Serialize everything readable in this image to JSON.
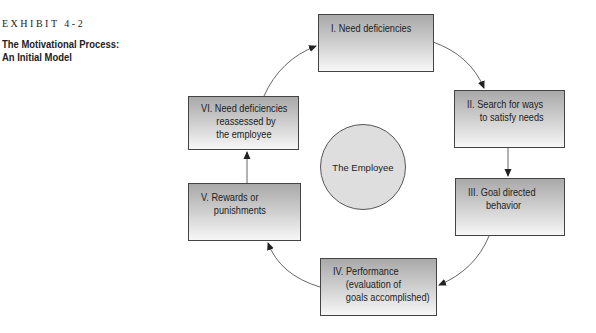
{
  "exhibit": {
    "label": "EXHIBIT 4-2"
  },
  "title": {
    "line1": "The Motivational Process:",
    "line2": "An Initial Model"
  },
  "center": {
    "label": "The Employee"
  },
  "steps": [
    {
      "id": "I",
      "text": "I. Need deficiencies"
    },
    {
      "id": "II",
      "text": "II. Search for ways\n     to satisfy needs"
    },
    {
      "id": "III",
      "text": "III. Goal directed\n       behavior"
    },
    {
      "id": "IV",
      "text": "IV. Performance\n     (evaluation of\n     goals accomplished)"
    },
    {
      "id": "V",
      "text": "V. Rewards or\n     punishments"
    },
    {
      "id": "VI",
      "text": "VI. Need deficiencies\n      reassessed by\n      the employee"
    }
  ],
  "colors": {
    "box_top": "#a9a9a9",
    "box_bottom": "#f7f7f7",
    "circle_fill": "#dedede",
    "line": "#444444"
  }
}
